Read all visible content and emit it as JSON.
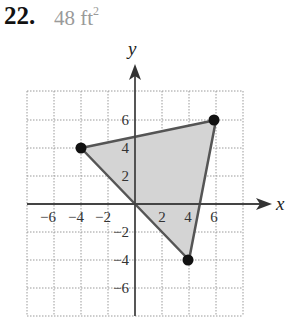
{
  "problem": {
    "number": "22.",
    "answer_value": "48 ft",
    "answer_exponent": "2"
  },
  "graph": {
    "x_axis_label": "x",
    "y_axis_label": "y",
    "x_tick_labels": [
      "−6",
      "−4",
      "−2",
      "2",
      "4",
      "6"
    ],
    "y_tick_labels": [
      "6",
      "4",
      "2",
      "−2",
      "−4",
      "−6"
    ],
    "grid_range": [
      -8,
      8
    ],
    "grid_step": 2,
    "triangle_vertices": [
      [
        -4,
        4
      ],
      [
        6,
        6
      ],
      [
        4,
        -4
      ]
    ],
    "fill_color": "#d4d4d4",
    "edge_color": "#555555"
  }
}
